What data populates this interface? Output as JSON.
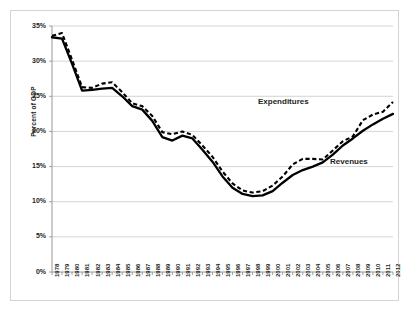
{
  "chart_data": {
    "type": "line",
    "title": "",
    "xlabel": "",
    "ylabel": "Percent of GDP",
    "ylim": [
      0,
      35
    ],
    "ytick_labels": [
      "0%",
      "5%",
      "10%",
      "15%",
      "20%",
      "25%",
      "30%",
      "35%"
    ],
    "ytick_values": [
      0,
      5,
      10,
      15,
      20,
      25,
      30,
      35
    ],
    "grid": true,
    "legend_position": "inline-annotation",
    "categories": [
      "1978",
      "1979",
      "1980",
      "1981",
      "1982",
      "1983",
      "1984",
      "1985",
      "1986",
      "1987",
      "1988",
      "1989",
      "1990",
      "1991",
      "1992",
      "1993",
      "1994",
      "1995",
      "1996",
      "1997",
      "1998",
      "1999",
      "2000",
      "2001",
      "2002",
      "2003",
      "2004",
      "2005",
      "2006",
      "2007",
      "2008",
      "2009",
      "2010",
      "2011",
      "2012"
    ],
    "series": [
      {
        "name": "Expenditures",
        "style": "dashed",
        "color": "#000000",
        "values": [
          33.6,
          34.0,
          30.2,
          26.3,
          26.2,
          26.8,
          27.0,
          25.6,
          24.0,
          23.6,
          22.2,
          19.9,
          19.6,
          20.0,
          19.5,
          18.0,
          16.4,
          14.3,
          12.6,
          11.6,
          11.3,
          11.5,
          12.3,
          13.6,
          15.3,
          16.1,
          16.1,
          16.0,
          17.3,
          18.6,
          19.3,
          21.6,
          22.4,
          22.8,
          24.2
        ]
      },
      {
        "name": "Revenues",
        "style": "solid",
        "color": "#000000",
        "values": [
          33.4,
          33.2,
          29.6,
          25.8,
          25.9,
          26.1,
          26.2,
          25.0,
          23.6,
          23.1,
          21.5,
          19.2,
          18.7,
          19.4,
          19.0,
          17.4,
          15.7,
          13.6,
          12.0,
          11.1,
          10.8,
          10.9,
          11.5,
          12.7,
          13.8,
          14.5,
          15.0,
          15.6,
          16.7,
          18.0,
          19.0,
          20.1,
          21.0,
          21.8,
          22.5
        ]
      }
    ],
    "annotations": [
      {
        "text": "Expenditures",
        "x_px": 258,
        "y_px": 97
      },
      {
        "text": "Revenues",
        "x_px": 330,
        "y_px": 157
      }
    ]
  }
}
